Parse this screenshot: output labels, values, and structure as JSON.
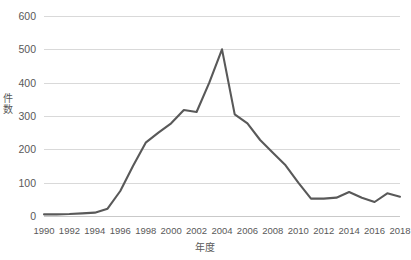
{
  "chart_data": {
    "type": "line",
    "title": "",
    "xlabel": "年度",
    "ylabel": "件数",
    "ylim": [
      0,
      600
    ],
    "xlim": [
      1990,
      2018
    ],
    "grid": true,
    "legend": false,
    "line_color": "#595959",
    "grid_color": "#d9d9d9",
    "text_color": "#595959",
    "y_ticks": [
      600,
      500,
      400,
      300,
      200,
      100,
      0
    ],
    "x_ticks": [
      1990,
      1992,
      1994,
      1996,
      1998,
      2000,
      2002,
      2004,
      2006,
      2008,
      2010,
      2012,
      2014,
      2016,
      2018
    ],
    "x": [
      1990,
      1991,
      1992,
      1993,
      1994,
      1995,
      1996,
      1997,
      1998,
      1999,
      2000,
      2001,
      2002,
      2003,
      2004,
      2005,
      2006,
      2007,
      2008,
      2009,
      2010,
      2011,
      2012,
      2013,
      2014,
      2015,
      2016,
      2017,
      2018
    ],
    "values": [
      5,
      5,
      6,
      8,
      10,
      22,
      75,
      150,
      220,
      250,
      278,
      318,
      312,
      400,
      500,
      305,
      278,
      228,
      190,
      152,
      100,
      52,
      52,
      55,
      72,
      55,
      42,
      68,
      58
    ],
    "series": [
      {
        "name": "件数",
        "values": [
          5,
          5,
          6,
          8,
          10,
          22,
          75,
          150,
          220,
          250,
          278,
          318,
          312,
          400,
          500,
          305,
          278,
          228,
          190,
          152,
          100,
          52,
          52,
          55,
          72,
          55,
          42,
          68,
          58
        ]
      }
    ]
  }
}
